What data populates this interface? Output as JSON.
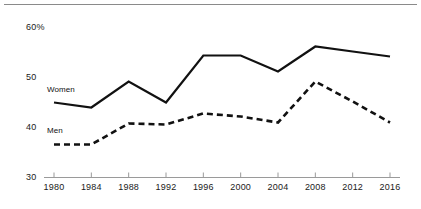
{
  "chart_data": {
    "type": "line",
    "title": "",
    "subtitle": "",
    "xlabel": "",
    "ylabel": "",
    "categories": [
      1980,
      1984,
      1988,
      1992,
      1996,
      2000,
      2004,
      2008,
      2012,
      2016
    ],
    "xticklabels": [
      "1980",
      "1984",
      "1988",
      "1992",
      "1996",
      "2000",
      "2004",
      "2008",
      "2012",
      "2016"
    ],
    "yticklabels": [
      "30",
      "40",
      "50",
      "60%"
    ],
    "ytickvalues": [
      30,
      40,
      50,
      60
    ],
    "ylim": [
      30,
      62
    ],
    "xlim": [
      1980,
      2016
    ],
    "grid": false,
    "legend_position": "inline",
    "series": [
      {
        "name": "Women",
        "style": "solid",
        "color": "#111111",
        "values": [
          45.0,
          44.0,
          49.2,
          45.0,
          54.4,
          54.4,
          51.2,
          56.2,
          55.2,
          54.2
        ]
      },
      {
        "name": "Men",
        "style": "dashed",
        "color": "#111111",
        "values": [
          36.6,
          36.6,
          40.8,
          40.6,
          42.8,
          42.2,
          41.0,
          49.2,
          45.2,
          41.0
        ]
      }
    ],
    "annotations": [
      {
        "text": "Women",
        "series": "Women",
        "x": 1980,
        "y": 47.5
      },
      {
        "text": "Men",
        "series": "Men",
        "x": 1980,
        "y": 39.3
      }
    ]
  },
  "axes": {
    "y": [
      {
        "label": "60%",
        "value": 60
      },
      {
        "label": "50",
        "value": 50
      },
      {
        "label": "40",
        "value": 40
      },
      {
        "label": "30",
        "value": 30
      }
    ],
    "x": [
      {
        "label": "1980",
        "value": 1980
      },
      {
        "label": "1984",
        "value": 1984
      },
      {
        "label": "1988",
        "value": 1988
      },
      {
        "label": "1992",
        "value": 1992
      },
      {
        "label": "1996",
        "value": 1996
      },
      {
        "label": "2000",
        "value": 2000
      },
      {
        "label": "2004",
        "value": 2004
      },
      {
        "label": "2008",
        "value": 2008
      },
      {
        "label": "2012",
        "value": 2012
      },
      {
        "label": "2016",
        "value": 2016
      }
    ]
  },
  "colors": {
    "line": "#111111",
    "axis": "#9a9a9a",
    "rule": "#8a8a8a",
    "text": "#1a1a1a",
    "background": "#ffffff"
  }
}
